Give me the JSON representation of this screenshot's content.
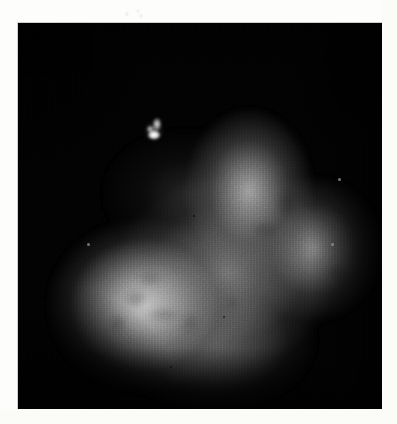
{
  "page": {
    "background_color": "#fdfdfb",
    "width": 397,
    "height": 424
  },
  "artifacts": {
    "top_smudge": {
      "name": "faint-ink-smudge",
      "x": 122,
      "y": 7,
      "width": 26,
      "height": 13,
      "description": "illegible light grey marking above the image panel"
    }
  },
  "scan": {
    "title": "",
    "panel": {
      "x": 18,
      "y": 23,
      "width": 364,
      "height": 386,
      "background_color": "#010101",
      "border_color": "#aaaaaa"
    },
    "modality": "grayscale-nuclear-medicine-scan",
    "colormap": "grayscale",
    "intensity_range": [
      0,
      255
    ],
    "features": [
      {
        "name": "focal-hot-spot",
        "label": "",
        "center_x": 136,
        "center_y": 108,
        "radius": 11,
        "peak_intensity": 255,
        "color": "#ffffff"
      },
      {
        "name": "lower-left-lobe",
        "label": "",
        "center_x": 126,
        "center_y": 282,
        "radius_x": 98,
        "radius_y": 88,
        "peak_intensity": 206,
        "color": "#cecece"
      },
      {
        "name": "upper-middle-lobe",
        "label": "",
        "center_x": 231,
        "center_y": 168,
        "radius_x": 66,
        "radius_y": 84,
        "peak_intensity": 196,
        "color": "#c4c4c4"
      },
      {
        "name": "right-lobe",
        "label": "",
        "center_x": 296,
        "center_y": 226,
        "radius_x": 70,
        "radius_y": 74,
        "peak_intensity": 180,
        "color": "#b4b4b4"
      },
      {
        "name": "central-mass",
        "label": "",
        "center_x": 208,
        "center_y": 250,
        "radius_x": 112,
        "radius_y": 98,
        "peak_intensity": 164,
        "color": "#a4a4a4"
      },
      {
        "name": "lower-central-body",
        "label": "",
        "center_x": 196,
        "center_y": 318,
        "radius_x": 104,
        "radius_y": 72,
        "peak_intensity": 158,
        "color": "#9e9e9e"
      }
    ],
    "speckles": [
      {
        "name": "speckle-dark-1",
        "x": 69,
        "y": 220,
        "size": 3,
        "color": "rgba(190,190,190,0.55)"
      },
      {
        "name": "speckle-dark-2",
        "x": 175,
        "y": 192,
        "size": 2,
        "color": "rgba(0,0,0,0.7)"
      },
      {
        "name": "speckle-bright-1",
        "x": 320,
        "y": 155,
        "size": 3,
        "color": "rgba(225,225,225,0.75)"
      },
      {
        "name": "speckle-bright-2",
        "x": 313,
        "y": 220,
        "size": 3,
        "color": "rgba(205,205,205,0.6)"
      },
      {
        "name": "speckle-dark-3",
        "x": 205,
        "y": 293,
        "size": 2,
        "color": "rgba(0,0,0,0.6)"
      },
      {
        "name": "speckle-dark-4",
        "x": 152,
        "y": 343,
        "size": 2,
        "color": "rgba(0,0,0,0.55)"
      }
    ],
    "texture": {
      "vertical_scanlines": true,
      "horizontal_raster": true,
      "film_grain": true,
      "vignette": true
    }
  }
}
